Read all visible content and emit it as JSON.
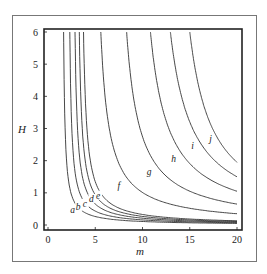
{
  "chart_data": {
    "type": "line",
    "title": "",
    "xlabel": "m",
    "ylabel": "H",
    "xlim": [
      0,
      20
    ],
    "ylim": [
      0,
      6
    ],
    "xticks": [
      0,
      5,
      10,
      15,
      20
    ],
    "yticks": [
      0,
      1,
      2,
      3,
      4,
      5,
      6
    ],
    "grid": false,
    "legend": "none (inline curve labels)",
    "series": [
      {
        "name": "a",
        "asymptote_m": 1.5,
        "label_pos": [
          2.6,
          0.4
        ],
        "end_H_at_m20": 0.05
      },
      {
        "name": "b",
        "asymptote_m": 2.1,
        "label_pos": [
          3.2,
          0.5
        ],
        "end_H_at_m20": 0.07
      },
      {
        "name": "c",
        "asymptote_m": 2.6,
        "label_pos": [
          3.9,
          0.6
        ],
        "end_H_at_m20": 0.09
      },
      {
        "name": "d",
        "asymptote_m": 3.0,
        "label_pos": [
          4.6,
          0.75
        ],
        "end_H_at_m20": 0.11
      },
      {
        "name": "e",
        "asymptote_m": 3.4,
        "label_pos": [
          5.3,
          0.85
        ],
        "end_H_at_m20": 0.13
      },
      {
        "name": "f",
        "asymptote_m": 4.7,
        "label_pos": [
          7.5,
          1.15
        ],
        "end_H_at_m20": 0.35
      },
      {
        "name": "g",
        "asymptote_m": 6.9,
        "label_pos": [
          10.7,
          1.6
        ],
        "end_H_at_m20": 0.65
      },
      {
        "name": "h",
        "asymptote_m": 8.9,
        "label_pos": [
          13.3,
          2.0
        ],
        "end_H_at_m20": 1.05
      },
      {
        "name": "i",
        "asymptote_m": 10.6,
        "label_pos": [
          15.3,
          2.4
        ],
        "end_H_at_m20": 1.5
      },
      {
        "name": "j",
        "asymptote_m": 12.6,
        "label_pos": [
          17.2,
          2.6
        ],
        "end_H_at_m20": 1.95
      }
    ]
  }
}
